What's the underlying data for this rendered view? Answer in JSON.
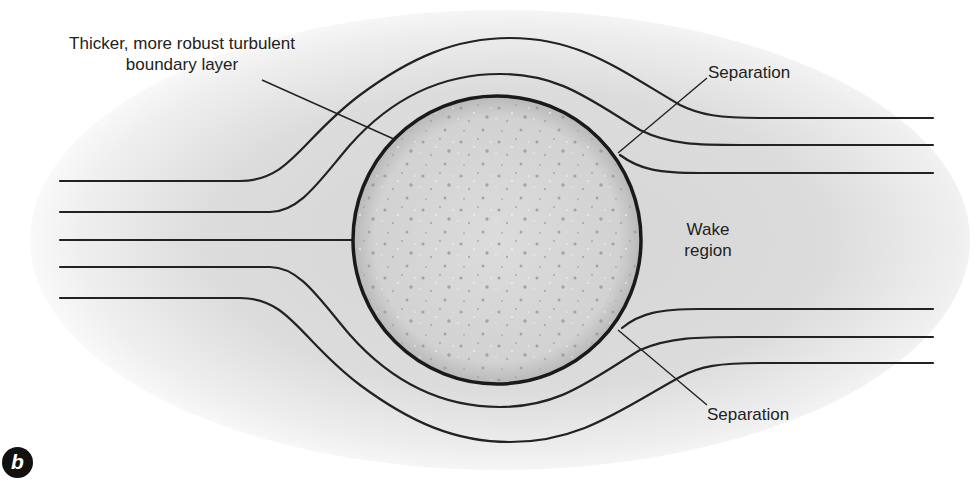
{
  "figure": {
    "panel_label": "b",
    "labels": {
      "boundary_layer_line1": "Thicker, more robust turbulent",
      "boundary_layer_line2": "boundary layer",
      "separation_top": "Separation",
      "separation_bottom": "Separation",
      "wake_line1": "Wake",
      "wake_line2": "region"
    },
    "colors": {
      "stroke": "#222222",
      "ball_fill": "#d6d6d6",
      "flow_shading": "#d9d9d9",
      "text": "#222222",
      "badge": "#111111"
    },
    "ball": {
      "cx": 497,
      "cy": 240,
      "r": 144
    },
    "streamlines_left_y": [
      181,
      212,
      240,
      267,
      298
    ],
    "streamlines_right_top_y": [
      118,
      145,
      173
    ],
    "streamlines_right_bottom_y": [
      309,
      337,
      363
    ]
  }
}
